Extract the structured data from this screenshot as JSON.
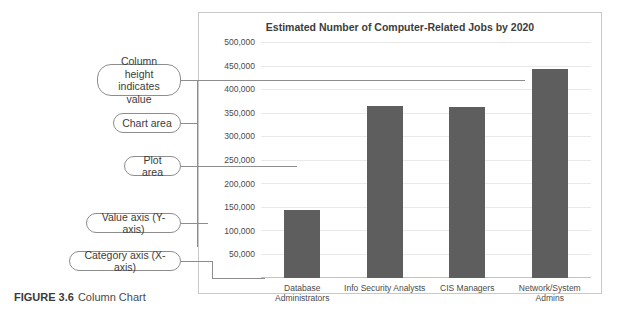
{
  "figure": {
    "caption_label": "FIGURE 3.6",
    "caption_text": "Column Chart"
  },
  "annotations": [
    {
      "id": "column-height",
      "label": "Column height\nindicates value"
    },
    {
      "id": "chart-area",
      "label": "Chart area"
    },
    {
      "id": "plot-area",
      "label": "Plot area"
    },
    {
      "id": "value-axis",
      "label": "Value axis (Y-axis)"
    },
    {
      "id": "category-axis",
      "label": "Category axis (X-axis)"
    }
  ],
  "colors": {
    "bar": "#5e5e5e",
    "grid": "#e9e9e9",
    "frame": "#c9c9c9",
    "callout_border": "#8d8d8d"
  },
  "chart_data": {
    "type": "bar",
    "title": "Estimated Number of Computer-Related Jobs by 2020",
    "xlabel": "",
    "ylabel": "",
    "categories": [
      "Database\nAdministrators",
      "Info Security Analysts",
      "CIS Managers",
      "Network/System\nAdmins"
    ],
    "values": [
      144000,
      367000,
      363000,
      444000
    ],
    "ylim": [
      0,
      500000
    ],
    "ytick_step": 50000,
    "ytick_labels": [
      "500,000",
      "450,000",
      "400,000",
      "350,000",
      "300,000",
      "250,000",
      "200,000",
      "150,000",
      "100,000",
      "50,000"
    ],
    "ytick_values": [
      500000,
      450000,
      400000,
      350000,
      300000,
      250000,
      200000,
      150000,
      100000,
      50000
    ],
    "grid": true,
    "legend": false
  }
}
